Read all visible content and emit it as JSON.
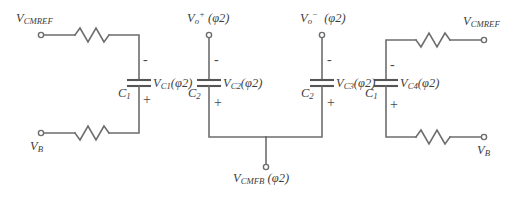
{
  "figure": {
    "kind": "switched-capacitor-common-mode-feedback-schematic",
    "background_color": "#ffffff",
    "wire_color": "#6d6d6d",
    "text_color": "#3d3d3d"
  },
  "nodes": [
    {
      "id": "vcmref-left",
      "label_main": "V",
      "label_sub": "CMREF",
      "label_sup": "",
      "label_phase": ""
    },
    {
      "id": "vb-left",
      "label_main": "V",
      "label_sub": "B",
      "label_sup": "",
      "label_phase": ""
    },
    {
      "id": "vo-plus",
      "label_main": "V",
      "label_sub": "o",
      "label_sup": "+",
      "label_phase": "(φ2)"
    },
    {
      "id": "vo-minus",
      "label_main": "V",
      "label_sub": "o",
      "label_sup": "−",
      "label_phase": "(φ2)"
    },
    {
      "id": "vcmfb",
      "label_main": "V",
      "label_sub": "CMFB",
      "label_sup": "",
      "label_phase": "(φ2)"
    },
    {
      "id": "vcmref-right",
      "label_main": "V",
      "label_sub": "CMREF",
      "label_sup": "",
      "label_phase": ""
    },
    {
      "id": "vb-right",
      "label_main": "V",
      "label_sub": "B",
      "label_sup": "",
      "label_phase": ""
    }
  ],
  "capacitors": [
    {
      "id": "cap-1",
      "name_main": "C",
      "name_sub": "1",
      "voltage_main": "V",
      "voltage_sub": "C1",
      "voltage_phase": "(φ2)",
      "top_sign": "-",
      "bottom_sign": "+"
    },
    {
      "id": "cap-2",
      "name_main": "C",
      "name_sub": "2",
      "voltage_main": "V",
      "voltage_sub": "C2",
      "voltage_phase": "(φ2)",
      "top_sign": "-",
      "bottom_sign": "+"
    },
    {
      "id": "cap-3",
      "name_main": "C",
      "name_sub": "2",
      "voltage_main": "V",
      "voltage_sub": "C3",
      "voltage_phase": "(φ2)",
      "top_sign": "-",
      "bottom_sign": "+"
    },
    {
      "id": "cap-4",
      "name_main": "C",
      "name_sub": "1",
      "voltage_main": "V",
      "voltage_sub": "C4",
      "voltage_phase": "(φ2)",
      "top_sign": "-",
      "bottom_sign": "+"
    }
  ],
  "resistors": [
    {
      "id": "resistor-top-left",
      "label": ""
    },
    {
      "id": "resistor-bottom-left",
      "label": ""
    },
    {
      "id": "resistor-top-right",
      "label": ""
    },
    {
      "id": "resistor-bottom-right",
      "label": ""
    }
  ]
}
